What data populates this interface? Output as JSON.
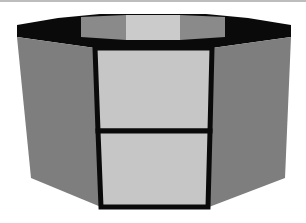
{
  "figure": {
    "type": "octagonal-prism",
    "colors": {
      "background": "#ffffff",
      "top_border_line": "#bdbdbd",
      "rim": "#0a0a0a",
      "outline": "#0a0a0a",
      "side_faces": "#7e7e7e",
      "front_faces": "#c6c6c6",
      "interior_side_faces": "#8a8a8a",
      "interior_back_face": "#cbcbcb"
    },
    "faces": {
      "left_side": [
        [
          17,
          37
        ],
        [
          95,
          48
        ],
        [
          101,
          207
        ],
        [
          31,
          178
        ]
      ],
      "right_side": [
        [
          212,
          48
        ],
        [
          291,
          37
        ],
        [
          285,
          178
        ],
        [
          209,
          207
        ]
      ],
      "front_upper": [
        [
          95,
          48
        ],
        [
          212,
          48
        ],
        [
          210,
          131
        ],
        [
          98,
          131
        ]
      ],
      "front_lower": [
        [
          98,
          131
        ],
        [
          210,
          131
        ],
        [
          208,
          207
        ],
        [
          101,
          207
        ]
      ],
      "rim": [
        [
          17,
          25
        ],
        [
          58,
          18
        ],
        [
          100,
          14
        ],
        [
          206,
          14
        ],
        [
          248,
          18
        ],
        [
          291,
          25
        ],
        [
          291,
          37
        ],
        [
          212,
          48
        ],
        [
          95,
          48
        ],
        [
          17,
          37
        ]
      ],
      "interior_left": [
        [
          81,
          17
        ],
        [
          126,
          15
        ],
        [
          126,
          40
        ],
        [
          81,
          37
        ]
      ],
      "interior_back": [
        [
          126,
          15
        ],
        [
          180,
          15
        ],
        [
          180,
          40
        ],
        [
          126,
          40
        ]
      ],
      "interior_right": [
        [
          180,
          15
        ],
        [
          225,
          17
        ],
        [
          225,
          37
        ],
        [
          180,
          40
        ]
      ]
    },
    "divider_y": 131
  }
}
